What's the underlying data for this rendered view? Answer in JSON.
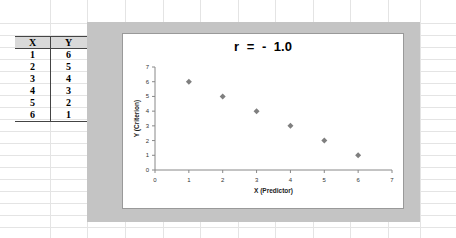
{
  "table": {
    "headers": [
      "X",
      "Y"
    ],
    "rows": [
      [
        "1",
        "6"
      ],
      [
        "2",
        "5"
      ],
      [
        "3",
        "4"
      ],
      [
        "4",
        "3"
      ],
      [
        "5",
        "2"
      ],
      [
        "6",
        "1"
      ]
    ]
  },
  "chart_data": {
    "type": "scatter",
    "title": "r  =  - 1.0",
    "xlabel": "X (Predictor)",
    "ylabel": "Y (Criterion)",
    "xlim": [
      0,
      7
    ],
    "ylim": [
      0,
      7
    ],
    "x_ticks": [
      0,
      1,
      2,
      3,
      4,
      5,
      6,
      7
    ],
    "y_ticks": [
      0,
      1,
      2,
      3,
      4,
      5,
      6,
      7
    ],
    "grid": false,
    "legend": null,
    "marker": "diamond",
    "marker_color": "#7f7f7f",
    "series": [
      {
        "name": "Y",
        "x": [
          1,
          2,
          3,
          4,
          5,
          6
        ],
        "y": [
          6,
          5,
          4,
          3,
          2,
          1
        ]
      }
    ]
  },
  "colors": {
    "chart_background": "#c4c4c4",
    "plot_background": "#ffffff",
    "header_fill": "#d9d9d9",
    "marker": "#7f7f7f"
  }
}
